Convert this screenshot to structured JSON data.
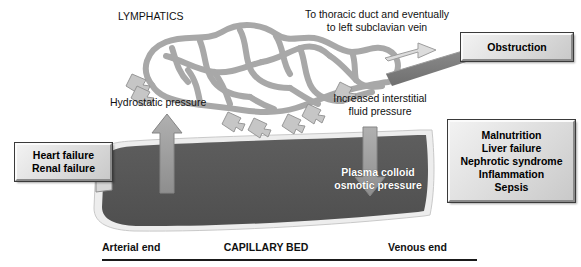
{
  "figure": {
    "title_text": "LYMPHATICS",
    "lymph_outflow_label": "To thoracic duct and eventually\nto left subclavian vein",
    "hydrostatic_label": "Hydrostatic pressure",
    "interstitial_label": "Increased interstitial\nfluid pressure",
    "oncotic_label": "Plasma colloid\nosmotic pressure",
    "arterial_end_label": "Arterial end",
    "capillary_bed_label": "CAPILLARY BED",
    "venous_end_label": "Venous end"
  },
  "boxes": {
    "obstruction": {
      "text": "Obstruction"
    },
    "left_causes": {
      "text": "Heart failure\nRenal failure"
    },
    "right_causes": {
      "text": "Malnutrition\nLiver failure\nNephrotic syndrome\nInflammation\nSepsis"
    }
  },
  "colors": {
    "lymph_vessel": "#a8a8a8",
    "thoracic_duct": "#7d7d7d",
    "capillary_fill": "#575757",
    "capillary_rim": "#e9e9e9",
    "arrow_gray": "#9a9a9a",
    "outflow_arrow": "#d2d2d2",
    "text": "#111111",
    "box_face": "#dcdcdc"
  },
  "icons": {
    "up_arrow": "up-arrow-icon",
    "down_arrow": "down-arrow-icon",
    "outflow_arrow": "right-arrow-icon",
    "valve_arrow": "lymph-intake-arrow-icon"
  }
}
